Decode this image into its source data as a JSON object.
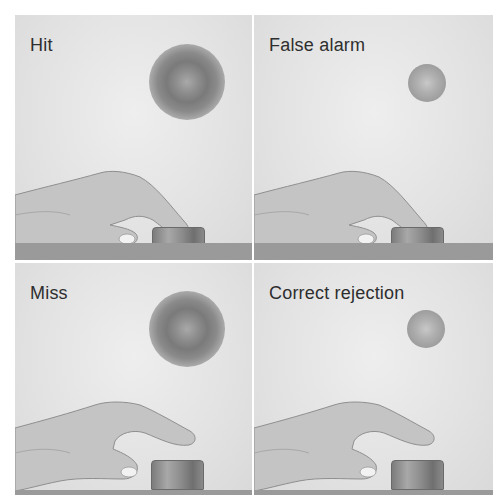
{
  "figure": {
    "column_headings": [
      "",
      ""
    ],
    "panels": [
      {
        "id": "hit",
        "label": "Hit",
        "stimulus": "large",
        "response": "pressed"
      },
      {
        "id": "false-alarm",
        "label": "False alarm",
        "stimulus": "small",
        "response": "pressed"
      },
      {
        "id": "miss",
        "label": "Miss",
        "stimulus": "large",
        "response": "not-pressed"
      },
      {
        "id": "correct-rejection",
        "label": "Correct rejection",
        "stimulus": "small",
        "response": "not-pressed"
      }
    ]
  },
  "colors": {
    "background": "#e4e4e4",
    "label_text": "#2e2e2e",
    "table": "#9a9a9a",
    "divider": "#ffffff"
  }
}
